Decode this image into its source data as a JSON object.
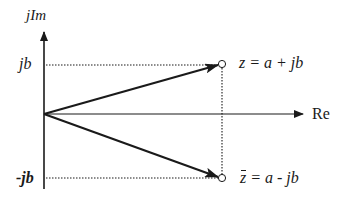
{
  "diagram": {
    "axes": {
      "imaginary_label": "jIm",
      "real_label": "Re"
    },
    "ticks": {
      "positive_imag": "jb",
      "negative_imag": "-jb"
    },
    "points": [
      {
        "name": "z",
        "label_var": "z",
        "label_rest": " = a + jb",
        "conjugate": false
      },
      {
        "name": "z-conjugate",
        "label_var": "z",
        "label_rest": " = a - jb",
        "conjugate": true
      }
    ],
    "colors": {
      "stroke": "#1a1a1a",
      "background": "#ffffff"
    }
  }
}
